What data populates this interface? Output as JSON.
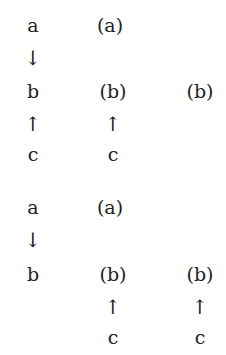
{
  "diagrams": [
    {
      "col1": {
        "top": "a",
        "arrow1": "↓",
        "mid": "b",
        "arrow2": "↑",
        "bottom": "c"
      },
      "col2": {
        "top": "(a)",
        "mid": "(b)",
        "arrow2": "↑",
        "bottom": "c"
      },
      "col3": {
        "mid": "(b)"
      }
    },
    {
      "col1": {
        "top": "a",
        "arrow1": "↓",
        "mid": "b"
      },
      "col2": {
        "top": "(a)",
        "mid": "(b)",
        "arrow2": "↑",
        "bottom": "c"
      },
      "col3": {
        "mid": "(b)",
        "arrow2": "↑",
        "bottom": "c"
      }
    }
  ]
}
